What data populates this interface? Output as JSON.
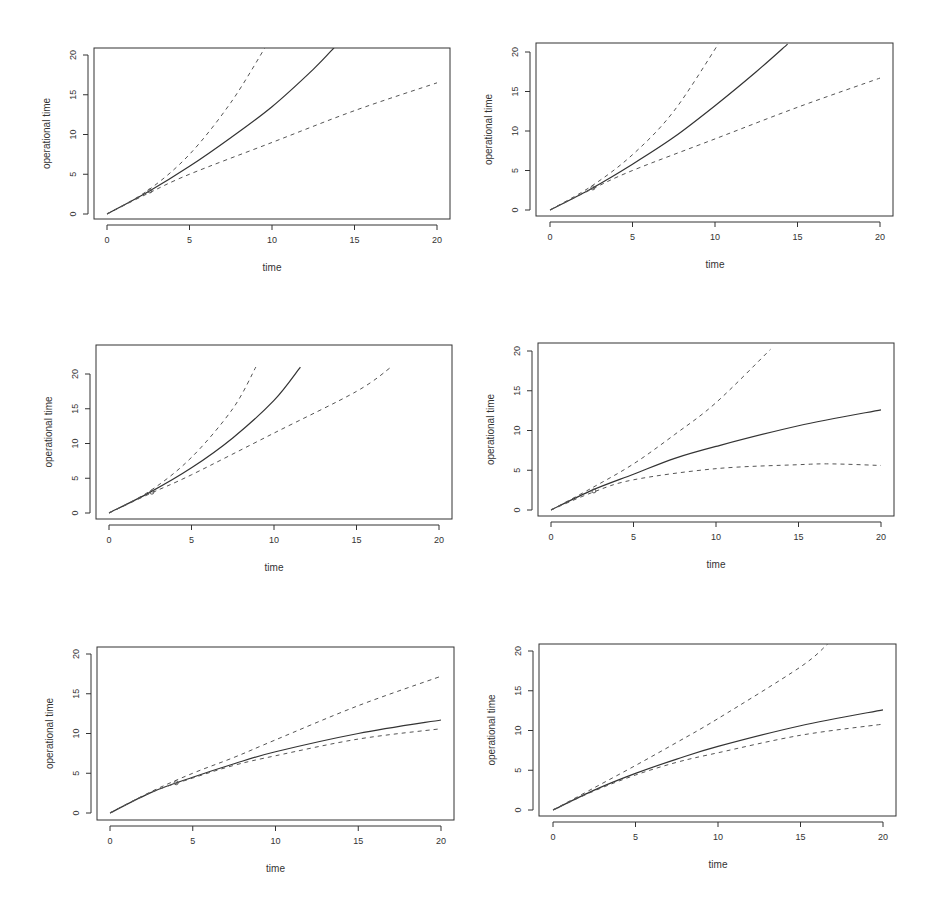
{
  "chart_data": [
    {
      "type": "line",
      "panel": "row1-left",
      "xlabel": "time",
      "ylabel": "operational time",
      "xlim": [
        0,
        20
      ],
      "ylim": [
        0,
        20
      ],
      "x_ticks": [
        "0",
        "5",
        "10",
        "15",
        "20"
      ],
      "y_ticks": [
        "0",
        "5",
        "10",
        "15",
        "20"
      ],
      "grid": false,
      "series": [
        {
          "name": "estimate",
          "style": "solid",
          "x": [
            0,
            2.5,
            5,
            7.5,
            10,
            12.5,
            13.8
          ],
          "y": [
            0,
            2.8,
            6,
            9.6,
            13.5,
            18.2,
            21
          ]
        },
        {
          "name": "upper",
          "style": "dashed",
          "x": [
            0,
            2.5,
            5,
            7.5,
            9.6
          ],
          "y": [
            0,
            3,
            7.5,
            14,
            21
          ]
        },
        {
          "name": "lower",
          "style": "dashed",
          "x": [
            0,
            2.5,
            5,
            10,
            15,
            20
          ],
          "y": [
            0,
            2.6,
            5,
            9,
            13,
            16.5
          ]
        }
      ],
      "markers": [
        {
          "x": 2.6,
          "y": 2.9
        }
      ]
    },
    {
      "type": "line",
      "panel": "row1-right",
      "xlabel": "time",
      "ylabel": "operational time",
      "xlim": [
        0,
        20
      ],
      "ylim": [
        0,
        20
      ],
      "x_ticks": [
        "0",
        "5",
        "10",
        "15",
        "20"
      ],
      "y_ticks": [
        "0",
        "5",
        "10",
        "15",
        "20"
      ],
      "grid": false,
      "series": [
        {
          "name": "estimate",
          "style": "solid",
          "x": [
            0,
            2.5,
            5,
            7.5,
            10,
            12.5,
            14.4
          ],
          "y": [
            0,
            2.7,
            5.8,
            9.2,
            13.2,
            17.5,
            21
          ]
        },
        {
          "name": "upper",
          "style": "dashed",
          "x": [
            0,
            2.5,
            5,
            7.5,
            10.2
          ],
          "y": [
            0,
            3,
            7,
            12.5,
            21
          ]
        },
        {
          "name": "lower",
          "style": "dashed",
          "x": [
            0,
            2.5,
            5,
            10,
            15,
            20
          ],
          "y": [
            0,
            2.6,
            5,
            9,
            13,
            16.7
          ]
        }
      ],
      "markers": [
        {
          "x": 2.6,
          "y": 2.8
        }
      ]
    },
    {
      "type": "line",
      "panel": "row2-left",
      "xlabel": "time",
      "ylabel": "operational time",
      "xlim": [
        0,
        20
      ],
      "ylim": [
        0,
        20
      ],
      "x_ticks": [
        "0",
        "5",
        "10",
        "15",
        "20"
      ],
      "y_ticks": [
        "0",
        "5",
        "10",
        "15",
        "20"
      ],
      "grid": false,
      "series": [
        {
          "name": "estimate",
          "style": "solid",
          "x": [
            0,
            2.5,
            5,
            7.5,
            10,
            11.6
          ],
          "y": [
            0,
            3,
            6.5,
            10.8,
            16.2,
            21
          ]
        },
        {
          "name": "upper",
          "style": "dashed",
          "x": [
            0,
            2.5,
            5,
            7.5,
            8.9
          ],
          "y": [
            0,
            3.2,
            8,
            15,
            21
          ]
        },
        {
          "name": "lower",
          "style": "dashed",
          "x": [
            0,
            2.5,
            5,
            10,
            15,
            17.1
          ],
          "y": [
            0,
            2.8,
            5.5,
            11.5,
            17.5,
            21
          ]
        }
      ],
      "markers": [
        {
          "x": 2.6,
          "y": 3.0
        }
      ]
    },
    {
      "type": "line",
      "panel": "row2-right",
      "xlabel": "time",
      "ylabel": "operational time",
      "xlim": [
        0,
        20
      ],
      "ylim": [
        0,
        20
      ],
      "x_ticks": [
        "0",
        "5",
        "10",
        "15",
        "20"
      ],
      "y_ticks": [
        "0",
        "5",
        "10",
        "15",
        "20"
      ],
      "grid": false,
      "series": [
        {
          "name": "estimate",
          "style": "solid",
          "x": [
            0,
            2.5,
            5,
            7.5,
            10,
            15,
            20
          ],
          "y": [
            0,
            2.5,
            4.5,
            6.5,
            8,
            10.6,
            12.6
          ]
        },
        {
          "name": "upper",
          "style": "dashed",
          "x": [
            0,
            2.5,
            5,
            7.5,
            10,
            13.3
          ],
          "y": [
            0,
            2.8,
            5.8,
            9.5,
            13.5,
            20.2
          ]
        },
        {
          "name": "lower",
          "style": "dashed",
          "x": [
            0,
            2.5,
            5,
            10,
            15,
            17,
            20
          ],
          "y": [
            0,
            2.2,
            3.8,
            5.2,
            5.7,
            5.8,
            5.6
          ]
        }
      ],
      "markers": [
        {
          "x": 2.6,
          "y": 2.4
        }
      ]
    },
    {
      "type": "line",
      "panel": "row3-left",
      "xlabel": "time",
      "ylabel": "operational time",
      "xlim": [
        0,
        20
      ],
      "ylim": [
        0,
        20
      ],
      "x_ticks": [
        "0",
        "5",
        "10",
        "15",
        "20"
      ],
      "y_ticks": [
        "0",
        "5",
        "10",
        "15",
        "20"
      ],
      "grid": false,
      "series": [
        {
          "name": "estimate",
          "style": "solid",
          "x": [
            0,
            2.5,
            5,
            7.5,
            10,
            15,
            20
          ],
          "y": [
            0,
            2.6,
            4.5,
            6.2,
            7.7,
            10,
            11.7
          ]
        },
        {
          "name": "upper",
          "style": "dashed",
          "x": [
            0,
            2.5,
            5,
            7.5,
            10,
            15,
            20
          ],
          "y": [
            0,
            2.7,
            5,
            7,
            9.2,
            13.5,
            17.2
          ]
        },
        {
          "name": "lower",
          "style": "dashed",
          "x": [
            0,
            2.5,
            5,
            7.5,
            10,
            15,
            20
          ],
          "y": [
            0,
            2.6,
            4.4,
            6,
            7.2,
            9.3,
            10.6
          ]
        }
      ],
      "markers": [
        {
          "x": 4.0,
          "y": 3.8
        }
      ]
    },
    {
      "type": "line",
      "panel": "row3-right",
      "xlabel": "time",
      "ylabel": "operational time",
      "xlim": [
        0,
        20
      ],
      "ylim": [
        0,
        20
      ],
      "x_ticks": [
        "0",
        "5",
        "10",
        "15",
        "20"
      ],
      "y_ticks": [
        "0",
        "5",
        "10",
        "15",
        "20"
      ],
      "grid": false,
      "series": [
        {
          "name": "estimate",
          "style": "solid",
          "x": [
            0,
            2.5,
            5,
            7.5,
            10,
            15,
            20
          ],
          "y": [
            0,
            2.5,
            4.6,
            6.4,
            8,
            10.6,
            12.6
          ]
        },
        {
          "name": "upper",
          "style": "dashed",
          "x": [
            0,
            2.5,
            5,
            7.5,
            10,
            15,
            16.7
          ],
          "y": [
            0,
            2.8,
            5.6,
            8.5,
            11.5,
            18,
            21
          ]
        },
        {
          "name": "lower",
          "style": "dashed",
          "x": [
            0,
            2.5,
            5,
            7.5,
            10,
            15,
            20
          ],
          "y": [
            0,
            2.4,
            4.4,
            6,
            7.2,
            9.4,
            10.8
          ]
        }
      ],
      "markers": []
    }
  ],
  "panels": [
    {
      "xlabel": "time",
      "ylabel": "operational time"
    },
    {
      "xlabel": "time",
      "ylabel": "operational time"
    },
    {
      "xlabel": "time",
      "ylabel": "operational time"
    },
    {
      "xlabel": "time",
      "ylabel": "operational time"
    },
    {
      "xlabel": "time",
      "ylabel": "operational time"
    },
    {
      "xlabel": "time",
      "ylabel": "operational time"
    }
  ],
  "colors": {
    "axis": "#333333",
    "solid_line": "#333333",
    "dashed_line": "#555555"
  }
}
